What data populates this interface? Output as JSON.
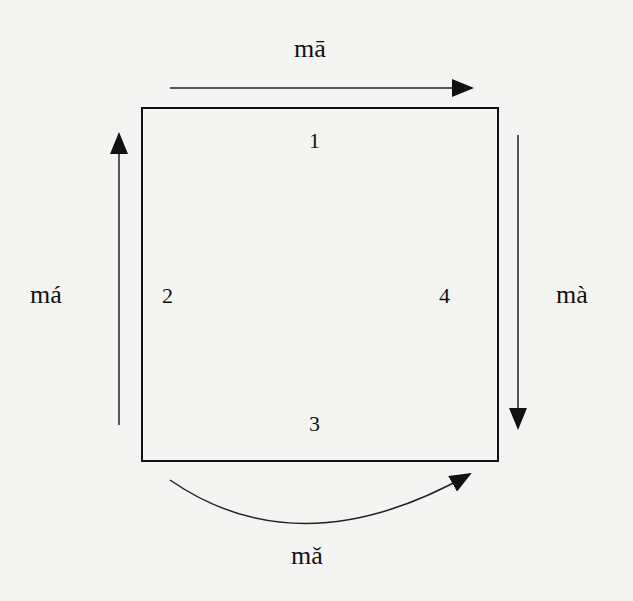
{
  "diagram": {
    "type": "tone-cycle",
    "box": {
      "x": 142,
      "y": 108,
      "width": 356,
      "height": 353
    },
    "tones": [
      {
        "number": "1",
        "syllable": "mā",
        "arrow_direction": "right",
        "position": "top"
      },
      {
        "number": "2",
        "syllable": "má",
        "arrow_direction": "up",
        "position": "left"
      },
      {
        "number": "3",
        "syllable": "mǎ",
        "arrow_direction": "curved-rising-right",
        "position": "bottom"
      },
      {
        "number": "4",
        "syllable": "mà",
        "arrow_direction": "down",
        "position": "right"
      }
    ],
    "colors": {
      "background": "#f4f4f2",
      "ink": "#111111"
    }
  }
}
